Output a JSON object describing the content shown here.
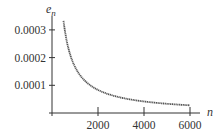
{
  "chart_data": {
    "type": "line",
    "title": "",
    "xlabel": "n",
    "ylabel": "e_n",
    "ylabel_base": "e",
    "ylabel_sub": "n",
    "xlim": [
      0,
      6500
    ],
    "ylim": [
      0,
      0.00035
    ],
    "x_ticks": [
      2000,
      4000,
      6000
    ],
    "x_tick_labels": [
      "2000",
      "4000",
      "6000"
    ],
    "y_ticks": [
      0.0001,
      0.0002,
      0.0003
    ],
    "y_tick_labels": [
      "0.0001",
      "0.0002",
      "0.0003"
    ],
    "grid": false,
    "legend": null,
    "series": [
      {
        "name": "e_n",
        "formula_estimate": "1/(6n)",
        "color": "#555555",
        "x": [
          500,
          750,
          1000,
          1500,
          2000,
          2500,
          3000,
          3500,
          4000,
          4500,
          5000,
          5500,
          6000
        ],
        "values": [
          0.000333,
          0.000222,
          0.000167,
          0.000111,
          8.33e-05,
          6.67e-05,
          5.56e-05,
          4.76e-05,
          4.17e-05,
          3.7e-05,
          3.33e-05,
          3.03e-05,
          2.78e-05
        ]
      }
    ]
  },
  "colors": {
    "axis": "#333333",
    "curve": "#555555"
  }
}
